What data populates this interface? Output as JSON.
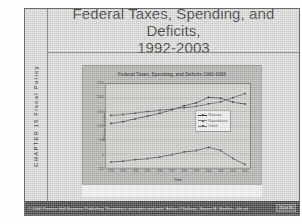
{
  "slide": {
    "title_line1": "Federal Taxes, Spending, and Deficits,",
    "title_line2": "1992-2003",
    "chapter_label": "CHAPTER 15  Fiscal Policy"
  },
  "footer": {
    "credit": "© 2006 Prentice Hall Business Publishing   “Economics: principles and tools”  Arthur O'Sullivan, Steven M. Sheffrin...4th ed.",
    "page_indicator": "15 of 35"
  },
  "colors": {
    "slide_background": "#d9d9d6",
    "chart_panel": "#a9a9a6",
    "plot_area": "#c8c8c5",
    "footer_bar": "#2b2b2b",
    "revenue": "#1f1f1f",
    "expenditures": "#333333",
    "deficit": "#2a2a2a"
  },
  "chart_data": {
    "type": "line",
    "title": "Federal Taxes, Spending, and Deficits 1992-2003",
    "xlabel": "Year",
    "ylabel": "Billions of dollars",
    "grid": true,
    "legend_position": "right",
    "categories": [
      "1992",
      "1993",
      "1994",
      "1995",
      "1996",
      "1997",
      "1998",
      "1999",
      "2000",
      "2001",
      "2002",
      "2003"
    ],
    "x": [
      1992,
      1993,
      1994,
      1995,
      1996,
      1997,
      1998,
      1999,
      2000,
      2001,
      2002,
      2003
    ],
    "ylim": [
      -500,
      2500
    ],
    "yticks": [
      -500,
      0,
      500,
      1000,
      1500,
      2000,
      2500
    ],
    "ytick_labels": [
      "-500",
      "0",
      "500",
      "1000",
      "1500",
      "2000",
      "2500"
    ],
    "series": [
      {
        "name": "Revenue",
        "values": [
          1091,
          1154,
          1259,
          1352,
          1453,
          1579,
          1722,
          1827,
          2025,
          1991,
          1853,
          1782
        ]
      },
      {
        "name": "Expenditures",
        "values": [
          1381,
          1409,
          1462,
          1516,
          1561,
          1601,
          1653,
          1702,
          1789,
          1863,
          2011,
          2157
        ]
      },
      {
        "name": "Deficit",
        "values": [
          -290,
          -255,
          -203,
          -164,
          -107,
          -22,
          69,
          125,
          236,
          128,
          -158,
          -375
        ]
      }
    ]
  }
}
